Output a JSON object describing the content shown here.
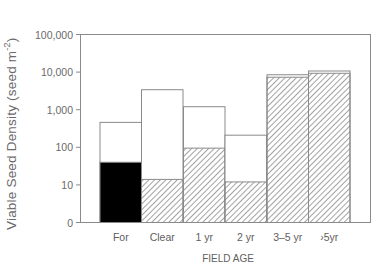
{
  "chart_data": {
    "type": "bar",
    "subtype": "stacked-overlay-log",
    "title": "",
    "xlabel": "FIELD AGE",
    "ylabel": "Viable Seed Density (seed m^-2)",
    "yscale": "log",
    "ylim": [
      1,
      100000
    ],
    "yticks": [
      1,
      10,
      100,
      1000,
      10000,
      100000
    ],
    "ytick_labels": [
      "0",
      "10",
      "100",
      "1,000",
      "10,000",
      "100,000"
    ],
    "grid": false,
    "legend": null,
    "categories": [
      "For",
      "Clear",
      "1 yr",
      "2 yr",
      "3-5 yr",
      ">5yr"
    ],
    "series": [
      {
        "name": "Total (open bar)",
        "fill": "white",
        "values": [
          460,
          3400,
          1200,
          210,
          8500,
          10700
        ]
      },
      {
        "name": "Inner portion",
        "fill": [
          "solid-black",
          "hatched",
          "hatched",
          "hatched",
          "hatched",
          "hatched"
        ],
        "values": [
          40,
          14,
          95,
          12,
          7300,
          9300
        ]
      }
    ]
  },
  "axis": {
    "ylabel_main": "Viable Seed Density (seed m",
    "ylabel_sup": "-2",
    "ylabel_close": ")",
    "xlabel": "FIELD AGE",
    "ytick_labels": [
      "0",
      "10",
      "100",
      "1,000",
      "10,000",
      "100,000"
    ],
    "xtick_labels": [
      "For",
      "Clear",
      "1 yr",
      "2 yr",
      "3–5 yr",
      "›5yr"
    ]
  },
  "colors": {
    "axis": "#888888",
    "bar_outline": "#8a8a8a",
    "solid_fill": "#000000",
    "hatch": "#7a7a7a",
    "text": "#555555"
  }
}
